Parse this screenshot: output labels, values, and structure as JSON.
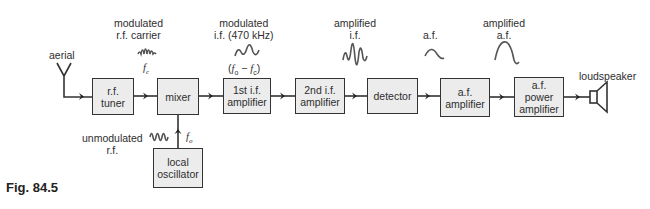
{
  "figure": {
    "label": "Fig. 84.5"
  },
  "blocks": {
    "rf_tuner": "r.f.\ntuner",
    "mixer": "mixer",
    "if1": "1st i.f.\namplifier",
    "if2": "2nd i.f.\namplifier",
    "detector": "detector",
    "af_amp": "a.f.\namplifier",
    "af_power": "a.f.\npower\namplifier",
    "local_osc": "local\noscillator"
  },
  "labels": {
    "aerial": "aerial",
    "loudspeaker": "loudspeaker",
    "modulated_rf": "modulated\nr.f. carrier",
    "fc": "f",
    "fc_sub": "c",
    "modulated_if": "modulated\ni.f. (470 kHz)",
    "fo_minus_fc": "(f₀ − fᴄ)",
    "amplified_if": "amplified\ni.f.",
    "af": "a.f.",
    "amplified_af": "amplified\na.f.",
    "unmodulated_rf": "unmodulated\nr.f.",
    "fo": "f",
    "fo_sub": "o"
  },
  "colors": {
    "box_fill": "#ececec",
    "line": "#333333",
    "wave": "#555555"
  }
}
